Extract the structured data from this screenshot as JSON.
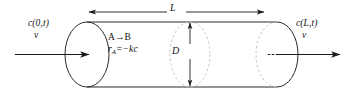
{
  "figure": {
    "name": "tubular-reactor-pfr-schematic",
    "background_color": "#ffffff",
    "stroke_color": "#222222",
    "dashed_color": "#b9b9b9"
  },
  "labels": {
    "inlet_concentration": "c(0,t)",
    "inlet_velocity": "v",
    "outlet_concentration": "c(L,t)",
    "outlet_velocity": "v",
    "reaction": "A→B",
    "rate_law_r": "r",
    "rate_law_sub": "A",
    "rate_law_rest": "=−kc",
    "length": "L",
    "diameter": "D"
  },
  "geometry": {
    "cylinder_top_y": 22,
    "cylinder_bottom_y": 87,
    "left_cap_cx": 87,
    "right_cap_cx": 277,
    "mid_ellipse_cx": 190,
    "cap_rx": 22,
    "cap_ry": 32,
    "length_arrow_y": 12,
    "length_arrow_x1": 88,
    "length_arrow_x2": 266,
    "flow_arrow_y": 54,
    "inlet_arrow_x1": 15,
    "inlet_arrow_x2": 90,
    "outlet_arrow_x1": 277,
    "outlet_arrow_x2": 341,
    "diameter_arrow_x": 190
  }
}
